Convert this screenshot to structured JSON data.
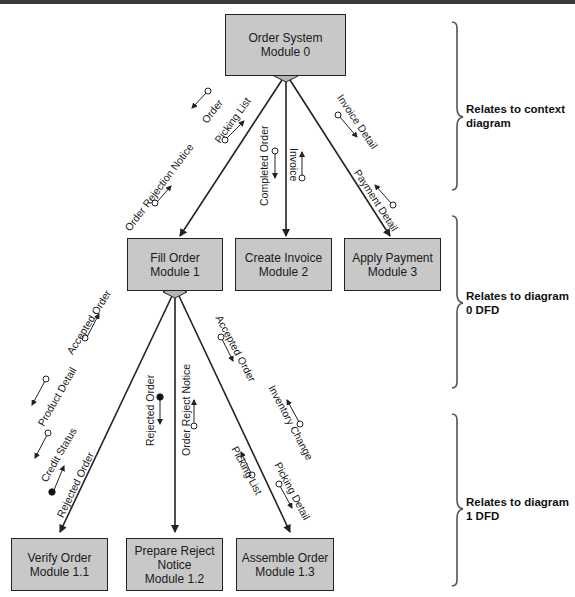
{
  "modules": {
    "m0": {
      "line1": "Order System",
      "line2": "Module 0"
    },
    "m1": {
      "line1": "Fill Order",
      "line2": "Module 1"
    },
    "m2": {
      "line1": "Create Invoice",
      "line2": "Module 2"
    },
    "m3": {
      "line1": "Apply Payment",
      "line2": "Module 3"
    },
    "m11": {
      "line1": "Verify Order",
      "line2": "Module 1.1"
    },
    "m12": {
      "line1": "Prepare Reject",
      "line2": "Notice",
      "line3": "Module 1.2"
    },
    "m13": {
      "line1": "Assemble Order",
      "line2": "Module 1.3"
    }
  },
  "flows": {
    "order": "Order",
    "picking_list_top": "Picking List",
    "order_rejection_notice": "Order Rejection Notice",
    "completed_order": "Completed Order",
    "invoice": "Invoice",
    "invoice_detail": "Invoice Detail",
    "payment_detail": "Payment Detail",
    "accepted_order_left": "Accepted Order",
    "product_detail": "Product Detail",
    "credit_status": "Credit Status",
    "rejected_order_left": "Rejected Order",
    "rejected_order_mid": "Rejected Order",
    "order_reject_notice": "Order Reject Notice",
    "accepted_order_right": "Accepted Order",
    "inventory_change": "Inventory Change",
    "picking_list_bottom": "Picking List",
    "picking_detail": "Picking Detail"
  },
  "notes": {
    "context": {
      "line1": "Relates to context",
      "line2": "diagram"
    },
    "diagram0": {
      "line1": "Relates to diagram",
      "line2": "0 DFD"
    },
    "diagram1": {
      "line1": "Relates to diagram",
      "line2": "1 DFD"
    }
  },
  "colors": {
    "module_fill": "#c8c8c8",
    "connector_fill": "#b5b5b5",
    "line": "#222222"
  }
}
